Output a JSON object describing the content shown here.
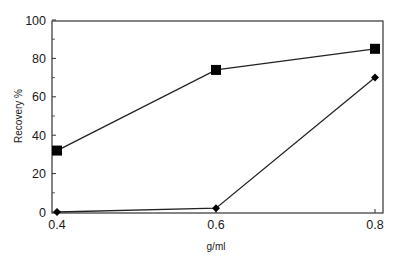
{
  "chart_data": {
    "type": "line",
    "title": "",
    "xlabel": "g/ml",
    "ylabel": "Recovery %",
    "x": [
      0.4,
      0.6,
      0.8
    ],
    "xticks": [
      "0.4",
      "0.6",
      "0.8"
    ],
    "yticks": [
      "0",
      "20",
      "40",
      "60",
      "80",
      "100"
    ],
    "xlim": [
      0.4,
      0.8
    ],
    "ylim": [
      0,
      100
    ],
    "grid": false,
    "legend": null,
    "series": [
      {
        "name": "square-marker series",
        "marker": "square",
        "values": [
          32,
          74,
          85
        ]
      },
      {
        "name": "diamond-marker series",
        "marker": "diamond",
        "values": [
          0,
          2,
          70
        ]
      }
    ]
  },
  "colors": {
    "line": "#222222",
    "frame": "#333333",
    "marker": "#000000"
  }
}
